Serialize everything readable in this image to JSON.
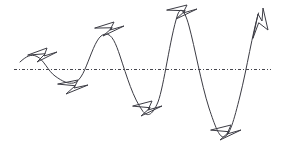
{
  "figure": {
    "title": "",
    "background_color": "#ffffff",
    "stroke_color": "#3c3c44",
    "axis_color": "#45454c",
    "width": 282,
    "height": 157
  },
  "chart_data": {
    "type": "line",
    "title": "",
    "xlabel": "",
    "ylabel": "",
    "grid": false,
    "legend_position": "none",
    "axis": {
      "kind": "baseline",
      "style": "dash-dot",
      "y_pixel": 69,
      "x_start": 14,
      "x_end": 271,
      "value": 0
    },
    "x": [
      20,
      37,
      55,
      73,
      89,
      105,
      124,
      143,
      161,
      178,
      200,
      223,
      241,
      259
    ],
    "y": [
      62,
      57,
      69,
      83,
      69,
      34,
      69,
      112,
      69,
      14,
      69,
      137,
      69,
      12
    ],
    "extrema": [
      {
        "index": 0,
        "kind": "peak",
        "x": 37,
        "y": 57,
        "amplitude": 12,
        "glyph": "arrowhead-right"
      },
      {
        "index": 1,
        "kind": "trough",
        "x": 73,
        "y": 83,
        "amplitude": -14,
        "glyph": "arrowhead-right"
      },
      {
        "index": 2,
        "kind": "peak",
        "x": 105,
        "y": 34,
        "amplitude": 35,
        "glyph": "arrowhead-right"
      },
      {
        "index": 3,
        "kind": "trough",
        "x": 143,
        "y": 112,
        "amplitude": -43,
        "glyph": "arrowhead-right"
      },
      {
        "index": 4,
        "kind": "peak",
        "x": 178,
        "y": 14,
        "amplitude": 55,
        "glyph": "arrowhead-right"
      },
      {
        "index": 5,
        "kind": "trough",
        "x": 223,
        "y": 137,
        "amplitude": -68,
        "glyph": "arrowhead-right"
      },
      {
        "index": 6,
        "kind": "peak",
        "x": 259,
        "y": 12,
        "amplitude": 57,
        "glyph": "arrowhead-up"
      }
    ],
    "series": [
      {
        "name": "wave",
        "values": [
          62,
          57,
          69,
          83,
          69,
          34,
          69,
          112,
          69,
          14,
          69,
          137,
          69,
          12
        ]
      }
    ],
    "xlim": [
      14,
      275
    ],
    "ylim": [
      0,
      157
    ]
  },
  "glyphs": {
    "arrowhead_right_label": "arrowhead-right",
    "arrowhead_up_label": "arrowhead-up",
    "count": 7
  },
  "paths": {
    "wave": "M 20 62 C 26 56.5 31 53.5 37 56.5 C 44 60 48 71 55 76 C 62.5 81.5 68 84 73.5 83 C 81 81.5 85.5 68 89.5 58 C 95 44 99 34.5 105.5 34 C 112 33.5 116 44 120 56 C 127 77 133 98 143 111.5 C 148 118 153 114 158 102 C 164 86 170 38 177.5 15 C 181 4.5 185.5 13 189 26 C 195 48 201 83 209 108 C 215 126 219 137 223.5 137 C 229.5 137 234 120 240 96 C 247 68 252.5 33 258.5 13",
    "axis": "M 14 69.5 L 271 69.5",
    "glyph_peak_1": "M 28 55 L 47 48 L 44 56 L 57 52 L 37 62 L 45 54 Z",
    "glyph_trough_1": "M 58 84 L 78 80 L 74 88 L 88 85 L 66 94 L 75 86 Z",
    "glyph_peak_2": "M 95 28 L 114 22 L 110 30 L 124 26 L 103 36 L 112 28 Z",
    "glyph_trough_2": "M 133 106 L 152 101 L 148 110 L 162 106 L 141 116 L 150 108 Z",
    "glyph_peak_3": "M 167 10 L 187 5 L 183 13 L 197 9 L 176 19 L 185 11 Z",
    "glyph_trough_3": "M 211 130 L 231 125 L 227 134 L 241 130 L 220 140 L 229 132 Z",
    "glyph_peak_4_up": "M 253 38 L 258 14 L 262 21 L 263 8 L 268 30 L 259 23 Z"
  }
}
